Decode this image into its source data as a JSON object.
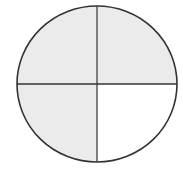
{
  "diagram": {
    "type": "fraction-circle",
    "total_parts": 4,
    "shaded_parts": 3,
    "fraction_label": "3/4",
    "parts": [
      {
        "position": "top-left",
        "shaded": true
      },
      {
        "position": "top-right",
        "shaded": true
      },
      {
        "position": "bottom-left",
        "shaded": true
      },
      {
        "position": "bottom-right",
        "shaded": false
      }
    ],
    "colors": {
      "shade": "#ebebeb",
      "unshaded": "#ffffff",
      "stroke": "#333333"
    }
  }
}
